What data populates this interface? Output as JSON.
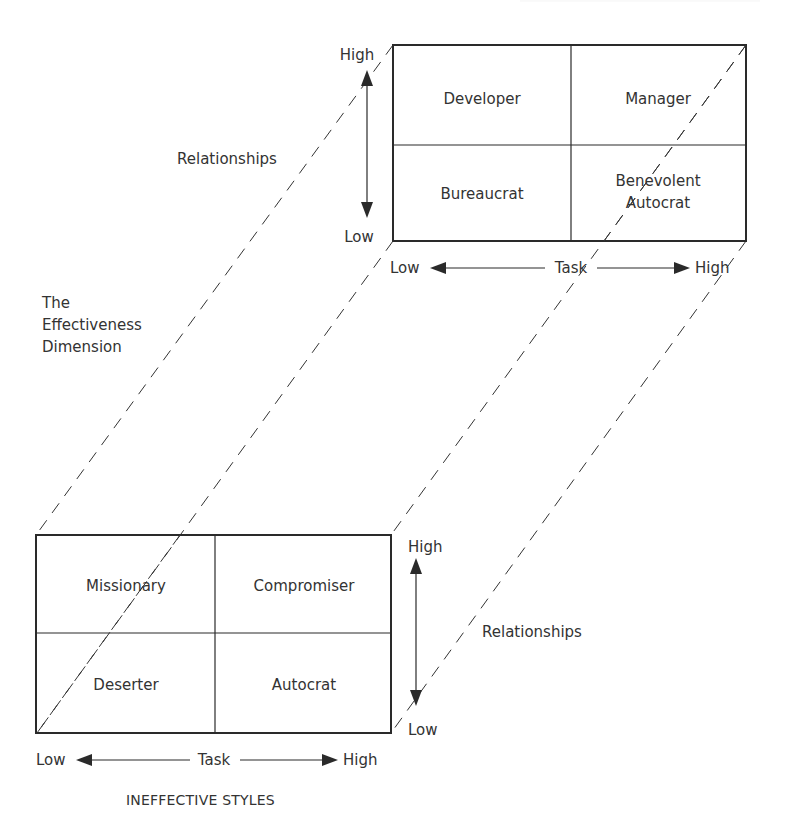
{
  "diagram": {
    "type": "3d-quadrant-model",
    "effective_grid": {
      "cells": {
        "top_left": "Developer",
        "top_right": "Manager",
        "bottom_left": "Bureaucrat",
        "bottom_right_line1": "Benevolent",
        "bottom_right_line2": "Autocrat"
      },
      "y_axis": {
        "high": "High",
        "low": "Low",
        "label": "Relationships"
      },
      "x_axis": {
        "low": "Low",
        "label": "Task",
        "high": "High"
      }
    },
    "ineffective_grid": {
      "cells": {
        "top_left": "Missionary",
        "top_right": "Compromiser",
        "bottom_left": "Deserter",
        "bottom_right": "Autocrat"
      },
      "y_axis": {
        "high": "High",
        "low": "Low",
        "label": "Relationships"
      },
      "x_axis": {
        "low": "Low",
        "label": "Task",
        "high": "High"
      },
      "caption": "INEFFECTIVE STYLES"
    },
    "depth_axis": {
      "line1": "The",
      "line2": "Effectiveness",
      "line3": "Dimension"
    }
  }
}
